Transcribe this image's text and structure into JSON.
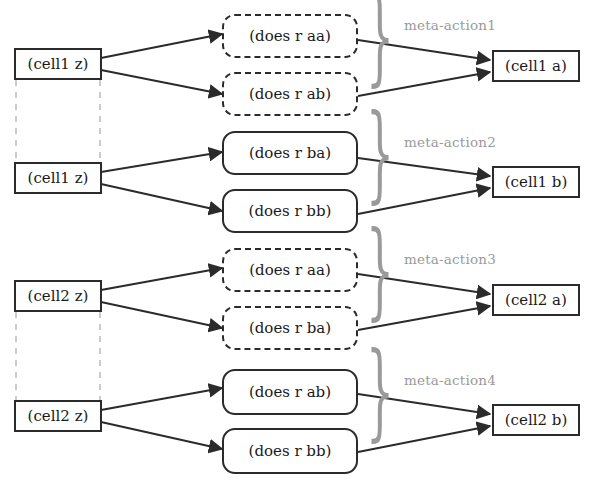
{
  "diagram": {
    "colors": {
      "stroke": "#2b2b2b",
      "meta_label": "#9a9a9a",
      "brace": "#9a9a9a",
      "dashed_connector": "#b0b0b0",
      "background": "#ffffff"
    },
    "groups": [
      {
        "id": "meta-action1",
        "meta_label": "meta-action1",
        "source_label": "(cell1 z)",
        "target_label": "(cell1 a)",
        "action_style": "dashed",
        "actions": [
          {
            "label": "(does r aa)"
          },
          {
            "label": "(does r ab)"
          }
        ]
      },
      {
        "id": "meta-action2",
        "meta_label": "meta-action2",
        "source_label": "(cell1 z)",
        "target_label": "(cell1 b)",
        "action_style": "solid",
        "actions": [
          {
            "label": "(does r ba)"
          },
          {
            "label": "(does r bb)"
          }
        ]
      },
      {
        "id": "meta-action3",
        "meta_label": "meta-action3",
        "source_label": "(cell2 z)",
        "target_label": "(cell2 a)",
        "action_style": "dashed",
        "actions": [
          {
            "label": "(does r aa)"
          },
          {
            "label": "(does r ba)"
          }
        ]
      },
      {
        "id": "meta-action4",
        "meta_label": "meta-action4",
        "source_label": "(cell2 z)",
        "target_label": "(cell2 b)",
        "action_style": "solid",
        "actions": [
          {
            "label": "(does r ab)"
          },
          {
            "label": "(does r bb)"
          }
        ]
      }
    ],
    "brace_glyph": "}"
  }
}
